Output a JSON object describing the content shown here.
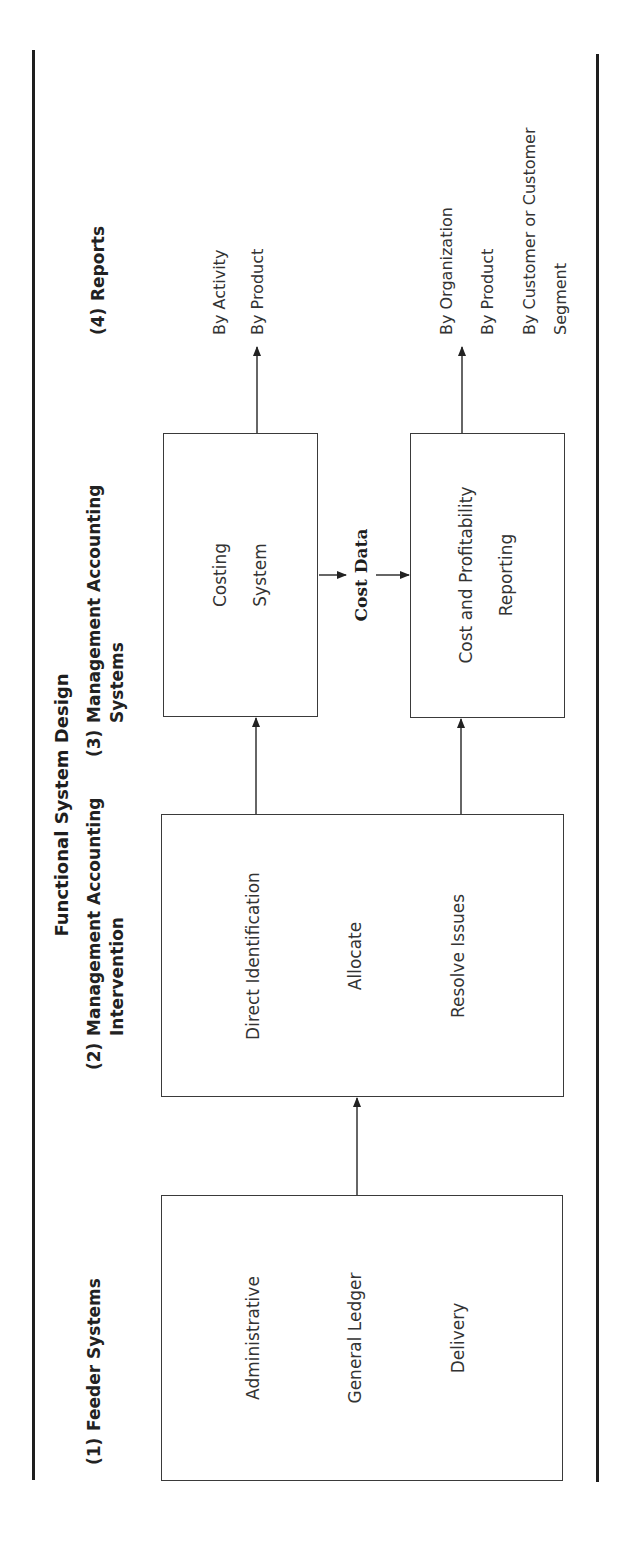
{
  "figure": {
    "title": "Functional System Design",
    "orientation": "rotated 90 degrees counter-clockwise"
  },
  "columns": [
    {
      "number": "(1)",
      "label_line1": "Feeder Systems",
      "label_line2": ""
    },
    {
      "number": "(2)",
      "label_line1": "Management Accounting",
      "label_line2": "Intervention"
    },
    {
      "number": "(3)",
      "label_line1": "Management Accounting",
      "label_line2": "Systems"
    },
    {
      "number": "(4)",
      "label_line1": "Reports",
      "label_line2": ""
    }
  ],
  "boxes": {
    "feeder": {
      "items": [
        "Administrative",
        "General Ledger",
        "Delivery"
      ]
    },
    "intervention": {
      "items": [
        "Direct Identification",
        "Allocate",
        "Resolve Issues"
      ]
    },
    "costing": {
      "line1": "Costing",
      "line2": "System"
    },
    "profitability": {
      "line1": "Cost and Profitability",
      "line2": "Reporting"
    }
  },
  "connector_label": "Cost Data",
  "reports": {
    "costing_outputs": [
      "By Activity",
      "By Product"
    ],
    "profitability_outputs": [
      "By Organization",
      "By Product",
      "By Customer or Customer",
      "Segment"
    ]
  },
  "colors": {
    "ink": "#2a2a2a",
    "rule": "#1e1e1e",
    "box_border": "#3a3a3a",
    "background": "#ffffff"
  }
}
